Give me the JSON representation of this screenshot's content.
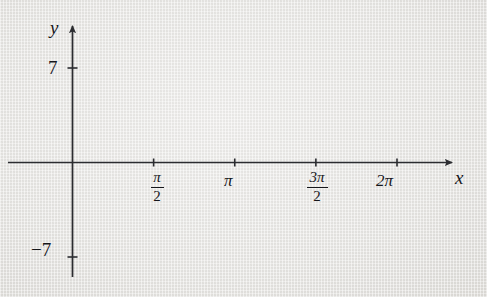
{
  "figure": {
    "background_color": "#e9e9e7",
    "axis_color": "#2b2c30",
    "label_color": "#15161a"
  },
  "axes": {
    "x_axis_label": "x",
    "y_axis_label": "y",
    "x_tick_labels": [
      {
        "name": "pi-over-2",
        "numerator": "π",
        "denominator": "2",
        "x_value": 1.5707963
      },
      {
        "name": "pi",
        "text": "π",
        "x_value": 3.1415927
      },
      {
        "name": "three-pi-over-2",
        "numerator": "3π",
        "denominator": "2",
        "x_value": 4.712389
      },
      {
        "name": "two-pi",
        "text": "2π",
        "x_value": 6.2831853
      }
    ],
    "y_tick_labels": [
      {
        "name": "y-tick-positive-7",
        "text": "7",
        "y_value": 7
      },
      {
        "name": "y-tick-negative-7",
        "text": "−7",
        "y_value": -7
      }
    ],
    "x_arrow": true,
    "y_arrow": true,
    "grid": false
  },
  "chart_data": {
    "type": "line",
    "title": "",
    "xlabel": "x",
    "ylabel": "y",
    "xlim": [
      -0.32,
      7.35
    ],
    "ylim": [
      -8.6,
      8.6
    ],
    "x_tick_values": [
      1.5707963,
      3.1415927,
      4.712389,
      6.2831853
    ],
    "y_tick_values": [
      7,
      -7
    ],
    "function_form": "y = A sin(2x)",
    "series": [
      {
        "name": "A = 7",
        "amplitude": 7.0,
        "frequency": 2,
        "color_dark": "#7e8085",
        "color_light": "#d9dada",
        "width": 2.6
      },
      {
        "name": "A = 5.7",
        "amplitude": 5.7,
        "frequency": 2,
        "color_dark": "#8c8e93",
        "color_light": "#dfe0e0",
        "width": 2.3
      },
      {
        "name": "A = 4.4",
        "amplitude": 4.4,
        "frequency": 2,
        "color_dark": "#989a9e",
        "color_light": "#e3e4e4",
        "width": 2.2
      },
      {
        "name": "A = 2.8",
        "amplitude": 2.8,
        "frequency": 2,
        "color_dark": "#a9abae",
        "color_light": "#e6e7e7",
        "width": 2.1
      }
    ],
    "legend": null,
    "legend_position": "none"
  }
}
